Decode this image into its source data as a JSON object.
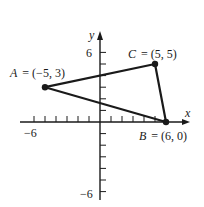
{
  "diagram": {
    "type": "coordinate-plane-triangle",
    "axes": {
      "x_label": "x",
      "y_label": "y",
      "x_range": [
        -6,
        7
      ],
      "y_range": [
        -6,
        7
      ],
      "tick_labels": {
        "x_min": "−6",
        "y_max": "6",
        "y_min": "−6"
      },
      "x_ticks": [
        -6,
        -5,
        -4,
        -3,
        -2,
        -1,
        1,
        2,
        3,
        4,
        5
      ],
      "y_ticks": [
        -6,
        -5,
        -4,
        -3,
        -2,
        -1,
        1,
        2,
        3,
        4,
        5,
        6
      ]
    },
    "points": [
      {
        "name": "A",
        "x": -5,
        "y": 3,
        "label_name": "A",
        "label_value": "= (−5, 3)"
      },
      {
        "name": "B",
        "x": 6,
        "y": 0,
        "label_name": "B",
        "label_value": "= (6, 0)"
      },
      {
        "name": "C",
        "x": 5,
        "y": 5,
        "label_name": "C",
        "label_value": "= (5, 5)"
      }
    ],
    "edges": [
      [
        "A",
        "C"
      ],
      [
        "C",
        "B"
      ],
      [
        "B",
        "A"
      ]
    ],
    "colors": {
      "ink": "#1a1a1a",
      "background": "#ffffff"
    }
  }
}
